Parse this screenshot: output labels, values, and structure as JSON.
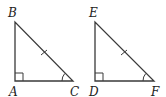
{
  "diagram": {
    "type": "geometry",
    "stroke_color": "#3a3a3a",
    "triangles": [
      {
        "name": "triangle-abc",
        "vertices": {
          "A": {
            "label": "A",
            "x": 15,
            "y": 81,
            "label_x": 9,
            "label_y": 96
          },
          "B": {
            "label": "B",
            "x": 15,
            "y": 22,
            "label_x": 8,
            "label_y": 17
          },
          "C": {
            "label": "C",
            "x": 73,
            "y": 81,
            "label_x": 70,
            "label_y": 96
          }
        },
        "right_angle_at": "A",
        "tick_mark_on": "BC",
        "angle_arc_at": "C"
      },
      {
        "name": "triangle-def",
        "vertices": {
          "D": {
            "label": "D",
            "x": 95,
            "y": 81,
            "label_x": 89,
            "label_y": 96
          },
          "E": {
            "label": "E",
            "x": 95,
            "y": 22,
            "label_x": 89,
            "label_y": 17
          },
          "F": {
            "label": "F",
            "x": 154,
            "y": 81,
            "label_x": 151,
            "label_y": 96
          }
        },
        "right_angle_at": "D",
        "tick_mark_on": "EF",
        "angle_arc_at": "F"
      }
    ]
  }
}
